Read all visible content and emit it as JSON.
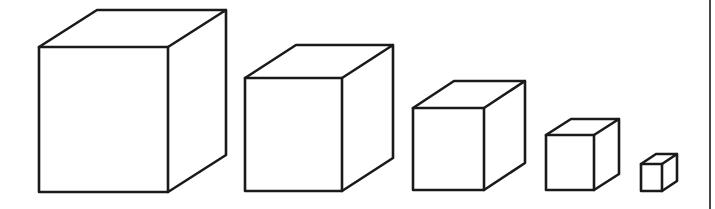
{
  "figure": {
    "line_color": "#1a1a1a",
    "background": "#ffffff",
    "right_border": {
      "x": 710,
      "y1": 0,
      "y2": 209
    },
    "cubes": [
      {
        "id": "cube-1",
        "front": {
          "x1": 39,
          "y1": 47,
          "x2": 168,
          "y2": 192
        },
        "depth": {
          "dx": 58,
          "dy": -37
        }
      },
      {
        "id": "cube-2",
        "front": {
          "x1": 245,
          "y1": 78,
          "x2": 342,
          "y2": 191
        },
        "depth": {
          "dx": 51,
          "dy": -33
        }
      },
      {
        "id": "cube-3",
        "front": {
          "x1": 413,
          "y1": 108,
          "x2": 484,
          "y2": 190
        },
        "depth": {
          "dx": 41,
          "dy": -27
        }
      },
      {
        "id": "cube-4",
        "front": {
          "x1": 546,
          "y1": 135,
          "x2": 594,
          "y2": 190
        },
        "depth": {
          "dx": 25,
          "dy": -16
        }
      },
      {
        "id": "cube-5",
        "front": {
          "x1": 641,
          "y1": 164,
          "x2": 662,
          "y2": 191
        },
        "depth": {
          "dx": 15,
          "dy": -10
        }
      }
    ]
  }
}
